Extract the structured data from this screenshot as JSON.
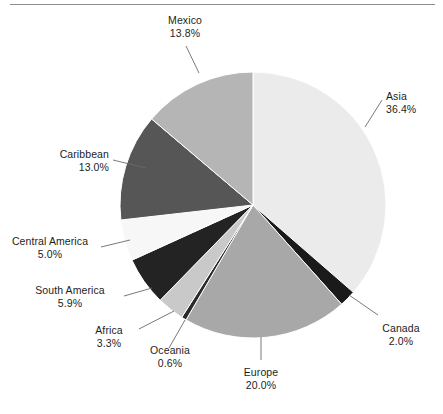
{
  "figure": {
    "title": "",
    "has_top_rule": true
  },
  "chart_data": {
    "type": "pie",
    "title": "",
    "xlabel": "",
    "ylabel": "",
    "legend_position": "none",
    "labels_style": "outside-with-leader-lines",
    "start_angle_deg": 0,
    "direction": "clockwise",
    "categories": [
      "Asia",
      "Canada",
      "Europe",
      "Oceania",
      "Africa",
      "South America",
      "Central America",
      "Caribbean",
      "Mexico"
    ],
    "values": [
      36.4,
      2.0,
      20.0,
      0.6,
      3.3,
      5.9,
      5.0,
      13.0,
      13.8
    ],
    "value_labels": [
      "36.4%",
      "2.0%",
      "20.0%",
      "0.6%",
      "3.3%",
      "5.9%",
      "5.0%",
      "13.0%",
      "13.8%"
    ],
    "unit": "%",
    "total": 100.0,
    "colors": [
      "#ebebeb",
      "#1a1a1a",
      "#a8a8a8",
      "#2b2b2b",
      "#c9c9c9",
      "#232323",
      "#f7f7f7",
      "#565656",
      "#b5b5b5"
    ],
    "slices": [
      {
        "label": "Asia",
        "value": 36.4,
        "value_label": "36.4%",
        "color": "#ebebeb"
      },
      {
        "label": "Canada",
        "value": 2.0,
        "value_label": "2.0%",
        "color": "#1a1a1a"
      },
      {
        "label": "Europe",
        "value": 20.0,
        "value_label": "20.0%",
        "color": "#a8a8a8"
      },
      {
        "label": "Oceania",
        "value": 0.6,
        "value_label": "0.6%",
        "color": "#2b2b2b"
      },
      {
        "label": "Africa",
        "value": 3.3,
        "value_label": "3.3%",
        "color": "#c9c9c9"
      },
      {
        "label": "South America",
        "value": 5.9,
        "value_label": "5.9%",
        "color": "#232323"
      },
      {
        "label": "Central America",
        "value": 5.0,
        "value_label": "5.0%",
        "color": "#f7f7f7"
      },
      {
        "label": "Caribbean",
        "value": 13.0,
        "value_label": "13.0%",
        "color": "#565656"
      },
      {
        "label": "Mexico",
        "value": 13.8,
        "value_label": "13.8%",
        "color": "#b5b5b5"
      }
    ]
  },
  "callouts": {
    "mexico": {
      "name": "Mexico",
      "pct": "13.8%"
    },
    "asia": {
      "name": "Asia",
      "pct": "36.4%"
    },
    "caribbean": {
      "name": "Caribbean",
      "pct": "13.0%"
    },
    "central_america": {
      "name": "Central America",
      "pct": "5.0%"
    },
    "south_america": {
      "name": "South America",
      "pct": "5.9%"
    },
    "africa": {
      "name": "Africa",
      "pct": "3.3%"
    },
    "oceania": {
      "name": "Oceania",
      "pct": "0.6%"
    },
    "europe": {
      "name": "Europe",
      "pct": "20.0%"
    },
    "canada": {
      "name": "Canada",
      "pct": "2.0%"
    }
  }
}
